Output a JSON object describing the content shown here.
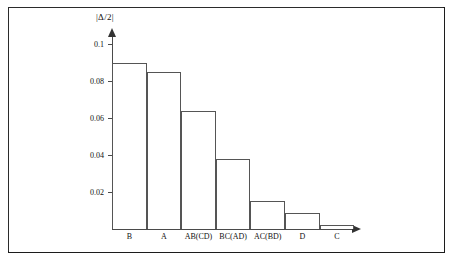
{
  "figure": {
    "frame_color": "#1c1c1c",
    "background": "#ffffff",
    "axis_color": "#4a4a4a",
    "bar_outline_color": "#555555",
    "bar_fill_color": "#ffffff"
  },
  "chart_data": {
    "type": "bar",
    "title": "",
    "subtitle": "",
    "xlabel": "",
    "ylabel": "|Δ/2|",
    "categories": [
      "B",
      "A",
      "AB(CD)",
      "BC(AD)",
      "AC(BD)",
      "D",
      "C"
    ],
    "values": [
      0.09,
      0.085,
      0.064,
      0.038,
      0.015,
      0.0085,
      0.002
    ],
    "ylim": [
      0,
      0.105
    ],
    "yticks": [
      0.02,
      0.04,
      0.06,
      0.08,
      0.1
    ],
    "ytick_labels": [
      "0.02",
      "0.04",
      "0.06",
      "0.08",
      "0.1"
    ],
    "grid": false,
    "legend": null,
    "legend_position": "none",
    "orientation": "vertical",
    "sorted": "descending",
    "axis_arrows": {
      "x": true,
      "y": true
    }
  },
  "axis": {
    "y_title": "|Δ/2|",
    "tick_labels": [
      "0.1",
      "0.08",
      "0.06",
      "0.04",
      "0.02"
    ]
  },
  "bars": [
    {
      "label": "B",
      "value": "0.09",
      "value_num": 0.09
    },
    {
      "label": "A",
      "value": "0.085",
      "value_num": 0.085
    },
    {
      "label": "AB(CD)",
      "value": "0.064",
      "value_num": 0.064
    },
    {
      "label": "BC(AD)",
      "value": "0.038",
      "value_num": 0.038
    },
    {
      "label": "AC(BD)",
      "value": "0.015",
      "value_num": 0.015
    },
    {
      "label": "D",
      "value": "0.0085",
      "value_num": 0.0085
    },
    {
      "label": "C",
      "value": "0.002",
      "value_num": 0.002
    }
  ]
}
